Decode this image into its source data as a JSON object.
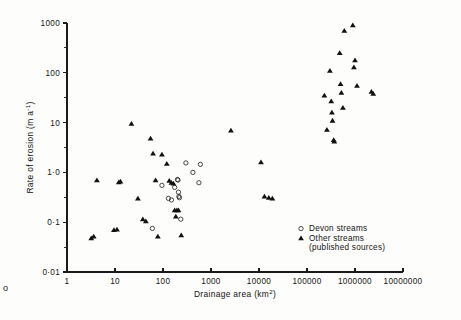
{
  "figure": {
    "background_color": "#fdfdfb",
    "ink_color": "#111111",
    "stray_mark": "o"
  },
  "chart_data": {
    "type": "scatter",
    "title": "",
    "xlabel": "Drainage area (km",
    "xlabel_sup": "2",
    "xlabel_close": ")",
    "ylabel": "Rate of erosion (m a",
    "ylabel_sup": "-1",
    "ylabel_close": ")",
    "xscale": "log",
    "yscale": "log",
    "xlim": [
      1,
      10000000
    ],
    "ylim": [
      0.01,
      1000
    ],
    "grid": false,
    "x_ticks": [
      1,
      10,
      100,
      1000,
      10000,
      100000,
      1000000,
      10000000
    ],
    "x_tick_labels": [
      "1",
      "10",
      "100",
      "1000",
      "10000",
      "100000",
      "1000000",
      "10000000"
    ],
    "y_ticks": [
      0.01,
      0.1,
      1,
      10,
      100,
      1000
    ],
    "y_tick_labels": [
      "0·01",
      "0·1",
      "1·0",
      "10",
      "100",
      "1000"
    ],
    "legend_position": "lower-right-inside",
    "series": [
      {
        "name": "Devon streams",
        "marker": "open-circle",
        "marker_color": "#2b2b2b",
        "points": [
          [
            60,
            0.075
          ],
          [
            95,
            0.55
          ],
          [
            130,
            0.3
          ],
          [
            150,
            0.28
          ],
          [
            175,
            0.5
          ],
          [
            200,
            0.72
          ],
          [
            205,
            0.7
          ],
          [
            210,
            0.4
          ],
          [
            215,
            0.33
          ],
          [
            220,
            0.31
          ],
          [
            235,
            0.115
          ],
          [
            300,
            1.55
          ],
          [
            420,
            1.0
          ],
          [
            600,
            1.45
          ],
          [
            560,
            0.62
          ]
        ]
      },
      {
        "name": "Other streams",
        "marker": "filled-triangle",
        "marker_color": "#111111",
        "legend_note": "(published sources)",
        "points": [
          [
            3.2,
            0.048
          ],
          [
            3.6,
            0.052
          ],
          [
            4.2,
            0.7
          ],
          [
            9.5,
            0.07
          ],
          [
            11,
            0.072
          ],
          [
            12,
            0.64
          ],
          [
            13,
            0.66
          ],
          [
            22,
            9.5
          ],
          [
            30,
            0.3
          ],
          [
            38,
            0.115
          ],
          [
            44,
            0.105
          ],
          [
            55,
            4.8
          ],
          [
            62,
            2.4
          ],
          [
            70,
            0.7
          ],
          [
            78,
            0.052
          ],
          [
            95,
            2.3
          ],
          [
            120,
            1.5
          ],
          [
            135,
            0.68
          ],
          [
            150,
            0.62
          ],
          [
            165,
            0.6
          ],
          [
            175,
            0.175
          ],
          [
            185,
            0.13
          ],
          [
            195,
            0.175
          ],
          [
            210,
            0.175
          ],
          [
            240,
            0.055
          ],
          [
            2600,
            7.0
          ],
          [
            11000,
            1.6
          ],
          [
            13000,
            0.33
          ],
          [
            16000,
            0.31
          ],
          [
            19000,
            0.3
          ],
          [
            230000,
            35
          ],
          [
            260000,
            7.2
          ],
          [
            300000,
            110
          ],
          [
            320000,
            27
          ],
          [
            330000,
            16
          ],
          [
            340000,
            11
          ],
          [
            360000,
            4.5
          ],
          [
            370000,
            4.2
          ],
          [
            480000,
            250
          ],
          [
            500000,
            60
          ],
          [
            520000,
            40
          ],
          [
            560000,
            20
          ],
          [
            600000,
            700
          ],
          [
            900000,
            900
          ],
          [
            950000,
            130
          ],
          [
            1000000,
            180
          ],
          [
            1100000,
            55
          ],
          [
            2200000,
            42
          ],
          [
            2400000,
            38
          ]
        ]
      }
    ]
  },
  "legend": {
    "entries": [
      {
        "label": "Devon streams",
        "marker": "open-circle"
      },
      {
        "label": "Other streams",
        "marker": "filled-triangle"
      }
    ],
    "note": "(published sources)"
  }
}
